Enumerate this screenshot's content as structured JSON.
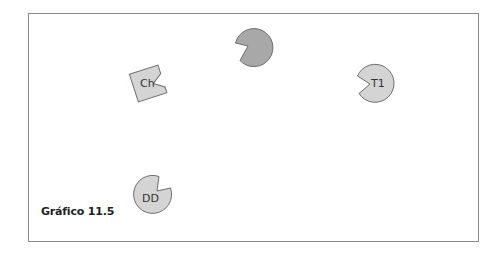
{
  "figure": {
    "caption": "Gráfico 11.5"
  },
  "colors": {
    "frame_border": "#8a8a8a",
    "shape_fill_light": "#d4d4d4",
    "shape_fill_dark": "#a8a8a8",
    "shape_stroke": "#6e6e6e",
    "text": "#333333"
  },
  "shapes": [
    {
      "id": "top-pacman",
      "type": "pacman",
      "label": "",
      "cx": 253,
      "cy": 47,
      "r": 19,
      "mouth": "left-lower",
      "fill": "dark"
    },
    {
      "id": "ch",
      "type": "notched-square",
      "label": "Ch",
      "cx": 148,
      "cy": 83,
      "rotation": -18,
      "notch": "right",
      "fill": "light"
    },
    {
      "id": "t1",
      "type": "pacman",
      "label": "T1",
      "cx": 375,
      "cy": 83,
      "r": 19,
      "mouth": "left",
      "fill": "light"
    },
    {
      "id": "dd",
      "type": "pacman",
      "label": "DD",
      "cx": 152,
      "cy": 194,
      "r": 19,
      "mouth": "upper-right",
      "fill": "light"
    }
  ]
}
